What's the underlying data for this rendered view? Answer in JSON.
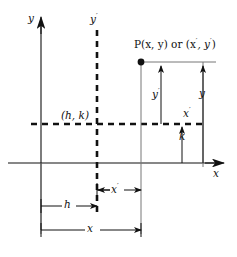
{
  "figure": {
    "kind": "coordinate-translation-diagram",
    "ink_color": "#111111",
    "background_color": "#ffffff"
  },
  "labels": {
    "y_axis": "y",
    "x_axis": "x",
    "y_prime_axis": "y",
    "y_prime_axis_prime": "′",
    "x_prime_axis": "x",
    "x_prime_axis_prime": "′",
    "point_label_main": "P(x, y) or (x",
    "point_label_prime1": "′",
    "point_label_mid": ", y",
    "point_label_prime2": "′",
    "point_label_end": ")",
    "point_label_full": "P(x, y) or (x′, y′)",
    "new_origin": "(h, k)",
    "dim_y_prime": "y",
    "dim_y_prime_mark": "′",
    "dim_y": "y",
    "dim_k": "k",
    "dim_x_prime": "x",
    "dim_x_prime_mark": "′",
    "dim_h": "h",
    "dim_x": "x"
  },
  "geometry": {
    "origin": {
      "x": 41,
      "y": 163
    },
    "new_origin": {
      "x": 97,
      "y": 124
    },
    "point_P": {
      "x": 141,
      "y": 62
    },
    "x_axis_arrow_tip_x": 225,
    "y_axis_arrow_tip_y": 18,
    "dim_line_x_prime_y": 190,
    "dim_line_h_y": 206,
    "dim_line_x_y": 230,
    "measure_y_prime_x": 161,
    "measure_y_x": 203,
    "measure_k_x": 182
  }
}
